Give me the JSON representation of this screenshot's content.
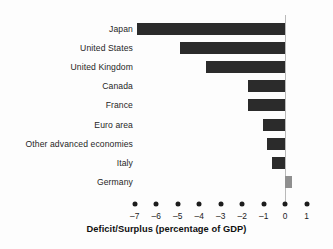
{
  "chart_data": {
    "type": "bar",
    "orientation": "horizontal",
    "title": "",
    "xlabel": "Deficit/Surplus (percentage of GDP)",
    "ylabel": "",
    "categories": [
      "Japan",
      "United States",
      "United Kingdom",
      "Canada",
      "France",
      "Euro area",
      "Other advanced economies",
      "Italy",
      "Germany"
    ],
    "values": [
      -6.9,
      -4.9,
      -3.7,
      -1.75,
      -1.75,
      -1.05,
      -0.85,
      -0.6,
      0.3
    ],
    "xlim": [
      -7.5,
      1.5
    ],
    "xticks": [
      -7,
      -6,
      -5,
      -4,
      -3,
      -2,
      -1,
      0,
      1
    ],
    "xticklabels": [
      "–7",
      "–6",
      "–5",
      "–4",
      "–3",
      "–2",
      "–1",
      "0",
      "1"
    ],
    "grid": false,
    "legend": null,
    "colors": {
      "negative_bar": "#2b2b2b",
      "positive_bar": "#8f8f8f",
      "zero_line": "#b9b9b9",
      "tick_dot": "#1c1c1c",
      "text": "#1c1c1c",
      "background": "#fdfdfd"
    }
  }
}
